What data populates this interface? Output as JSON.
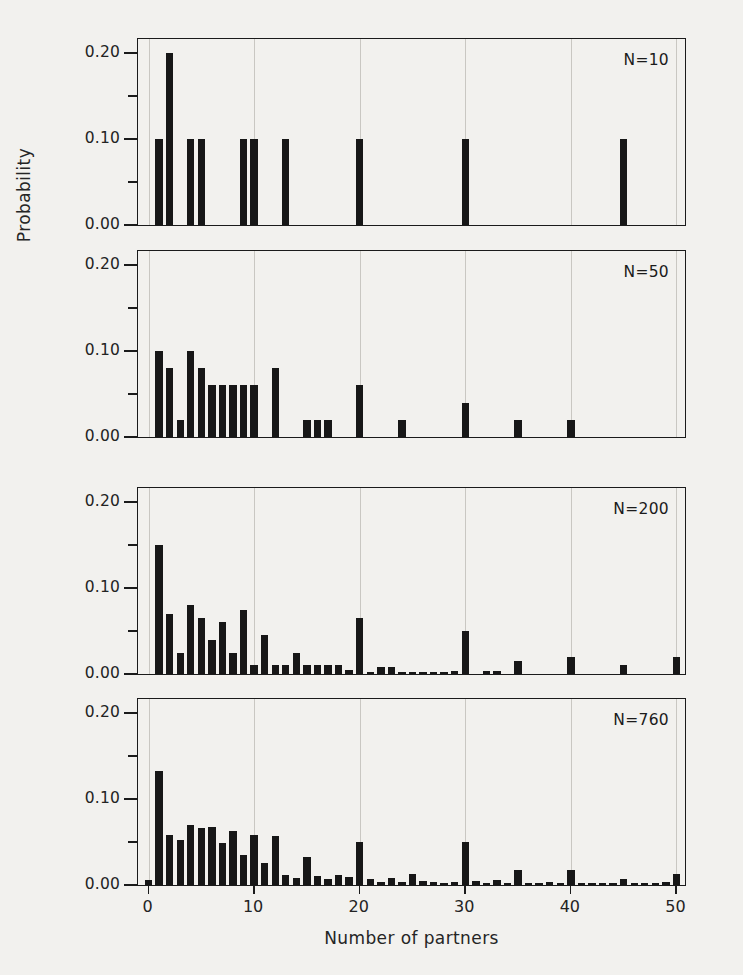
{
  "chart_data": {
    "type": "bar",
    "title": "",
    "xlabel": "Number of partners",
    "ylabel": "Probability",
    "xlim": [
      -1,
      51
    ],
    "ylim": [
      0.0,
      0.215
    ],
    "grid": "vertical gridlines at x = 0, 10, 20, 30, 40, 50",
    "legend": "none; each panel annotated with sample size N",
    "y_ticks": [
      "0.00",
      "0.10",
      "0.20"
    ],
    "y_tick_values": [
      0.0,
      0.1,
      0.2
    ],
    "y_minor_tick_values": [
      0.05,
      0.15
    ],
    "x_ticks": [
      "0",
      "10",
      "20",
      "30",
      "40",
      "50"
    ],
    "x_tick_values": [
      0,
      10,
      20,
      30,
      40,
      50
    ],
    "panels": [
      {
        "annotation": "N=10",
        "x": [
          1,
          2,
          4,
          5,
          9,
          10,
          13,
          20,
          30,
          45
        ],
        "values": [
          0.1,
          0.2,
          0.1,
          0.1,
          0.1,
          0.1,
          0.1,
          0.1,
          0.1,
          0.1
        ]
      },
      {
        "annotation": "N=50",
        "x": [
          1,
          2,
          3,
          4,
          5,
          6,
          7,
          8,
          9,
          10,
          12,
          15,
          16,
          17,
          20,
          24,
          30,
          35,
          40
        ],
        "values": [
          0.1,
          0.08,
          0.02,
          0.1,
          0.08,
          0.06,
          0.06,
          0.06,
          0.06,
          0.06,
          0.08,
          0.02,
          0.02,
          0.02,
          0.06,
          0.02,
          0.04,
          0.02,
          0.02
        ]
      },
      {
        "annotation": "N=200",
        "x": [
          1,
          2,
          3,
          4,
          5,
          6,
          7,
          8,
          9,
          10,
          11,
          12,
          13,
          14,
          15,
          16,
          17,
          18,
          19,
          20,
          21,
          22,
          23,
          24,
          25,
          26,
          27,
          28,
          29,
          30,
          32,
          33,
          35,
          40,
          45,
          50
        ],
        "values": [
          0.15,
          0.07,
          0.025,
          0.08,
          0.065,
          0.04,
          0.06,
          0.025,
          0.075,
          0.01,
          0.045,
          0.01,
          0.01,
          0.025,
          0.01,
          0.01,
          0.01,
          0.01,
          0.005,
          0.065,
          0.002,
          0.008,
          0.008,
          0.002,
          0.002,
          0.002,
          0.002,
          0.002,
          0.003,
          0.05,
          0.004,
          0.004,
          0.015,
          0.02,
          0.01,
          0.02
        ]
      },
      {
        "annotation": "N=760",
        "x": [
          0,
          1,
          2,
          3,
          4,
          5,
          6,
          7,
          8,
          9,
          10,
          11,
          12,
          13,
          14,
          15,
          16,
          17,
          18,
          19,
          20,
          21,
          22,
          23,
          24,
          25,
          26,
          27,
          28,
          29,
          30,
          31,
          32,
          33,
          34,
          35,
          36,
          37,
          38,
          39,
          40,
          41,
          42,
          43,
          44,
          45,
          46,
          47,
          48,
          49,
          50
        ],
        "values": [
          0.006,
          0.133,
          0.058,
          0.052,
          0.07,
          0.066,
          0.067,
          0.049,
          0.063,
          0.035,
          0.058,
          0.026,
          0.057,
          0.012,
          0.008,
          0.033,
          0.01,
          0.007,
          0.012,
          0.009,
          0.05,
          0.007,
          0.004,
          0.008,
          0.003,
          0.013,
          0.005,
          0.003,
          0.002,
          0.004,
          0.05,
          0.005,
          0.002,
          0.006,
          0.002,
          0.017,
          0.002,
          0.002,
          0.003,
          0.002,
          0.017,
          0.002,
          0.002,
          0.002,
          0.002,
          0.007,
          0.002,
          0.002,
          0.002,
          0.003,
          0.013
        ]
      }
    ]
  },
  "axis": {
    "ylabel_text": "Probability",
    "xlabel_text": "Number of partners"
  }
}
